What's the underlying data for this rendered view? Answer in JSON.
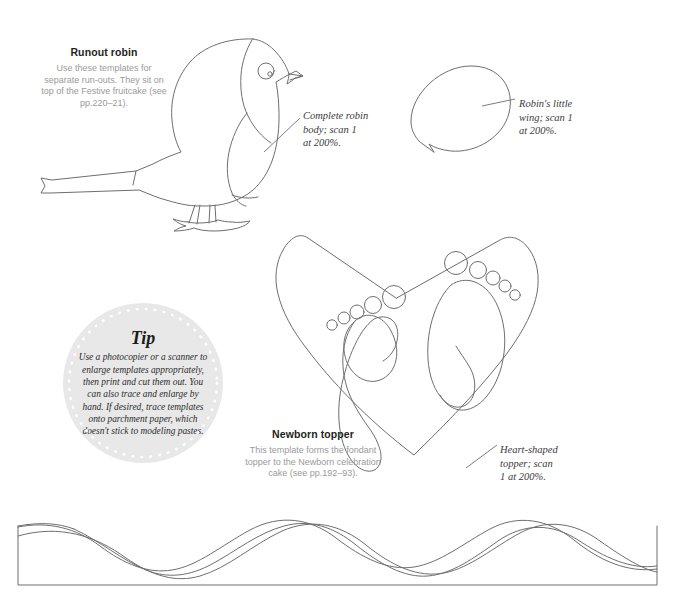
{
  "page": {
    "background_color": "#ffffff",
    "line_color": "#6e6e6e",
    "caption_heading_color": "#231f20",
    "caption_body_color": "#9a9a9a",
    "annotation_color": "#3b3b3b",
    "tip_fill_color": "#e8e8e8"
  },
  "captions": [
    {
      "id": "runout-robin",
      "heading": "Runout robin",
      "body": "Use these templates for separate run-outs. They sit on top of the Festive fruitcake (see pp.220–21)."
    },
    {
      "id": "newborn-topper",
      "heading": "Newborn topper",
      "body": "This template forms the fondant topper to the Newborn celebration cake (see pp.192–93)."
    }
  ],
  "annotations": [
    {
      "id": "robin-body",
      "text": "Complete robin\nbody; scan 1\nat 200%."
    },
    {
      "id": "robin-wing",
      "text": "Robin's little\nwing; scan 1\nat 200%."
    },
    {
      "id": "heart-topper",
      "text": "Heart-shaped\ntopper; scan\n1 at 200%."
    }
  ],
  "tip": {
    "title": "Tip",
    "body": "Use a photocopier or a scanner to enlarge templates appropriately, then print and cut them out. You can also trace and enlarge by hand. If desired, trace templates onto parchment paper, which doesn't stick to modeling pastes."
  },
  "templates": [
    {
      "id": "robin-body-shape",
      "name": "robin-outline"
    },
    {
      "id": "robin-wing-shape",
      "name": "wing-outline"
    },
    {
      "id": "heart-shape",
      "name": "heart-with-footprints-outline"
    },
    {
      "id": "braid-band",
      "name": "braid-band-outline"
    }
  ]
}
